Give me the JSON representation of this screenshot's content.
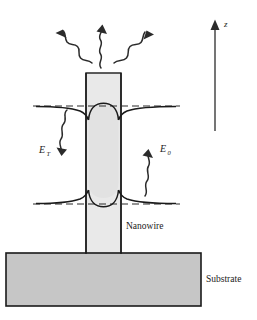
{
  "figure": {
    "background_color": "#ffffff",
    "width": 257,
    "height": 320
  },
  "labels": {
    "nanowire": "Nanowire",
    "substrate": "Substrate",
    "axis_z": "z",
    "field_transmitted": "E",
    "field_transmitted_sub": "T",
    "field_incident": "E",
    "field_incident_sub": "0"
  },
  "colors": {
    "outline": "#1a1a1a",
    "nanowire_fill": "#e9e9e9",
    "nanowire_core_fill": "#e2e2e2",
    "substrate_fill": "#c6c6c6",
    "dashed_line": "#2b2b2b",
    "curve": "#1a1a1a",
    "arrow": "#2b2b2b",
    "text": "#1a1a1a"
  },
  "geometry": {
    "nanowire": {
      "x_left": 86,
      "x_right": 121,
      "y_top": 73,
      "y_bottom": 254,
      "width": 35
    },
    "substrate": {
      "x_left": 6,
      "x_right": 201,
      "y_top": 253,
      "y_bottom": 306,
      "width": 195,
      "height": 53
    },
    "dashed_line_upper": {
      "y": 106,
      "x_start": 33,
      "x_end": 180
    },
    "dashed_line_lower": {
      "y": 204,
      "x_start": 33,
      "x_end": 180
    },
    "z_axis": {
      "x": 215,
      "y_top": 20,
      "y_bottom": 131
    }
  },
  "emission_arrows": [
    {
      "name": "upper-left-wave-arrow",
      "direction": "up-left",
      "tip_x": 62,
      "tip_y": 20
    },
    {
      "name": "upper-center-wave-arrow",
      "direction": "up",
      "tip_x": 104,
      "tip_y": 16
    },
    {
      "name": "upper-right-wave-arrow",
      "direction": "up-right",
      "tip_x": 152,
      "tip_y": 21
    }
  ],
  "field_arrows": [
    {
      "name": "transmitted-field-arrow",
      "label": "E_T",
      "direction": "down",
      "x": 64,
      "y_start": 112,
      "y_end": 168
    },
    {
      "name": "incident-field-arrow",
      "label": "E_0",
      "direction": "up",
      "x": 145,
      "y_start": 198,
      "y_end": 146
    }
  ]
}
